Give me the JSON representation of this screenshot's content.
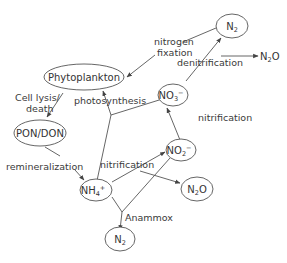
{
  "diagram": {
    "nodes": {
      "phytoplankton": "Phytoplankton",
      "pon_don": "PON/DON",
      "nh4": {
        "base": "NH",
        "sub": "4",
        "sup": "+"
      },
      "no2": {
        "base": "NO",
        "sub": "2",
        "sup": "−"
      },
      "no3": {
        "base": "NO",
        "sub": "3",
        "sup": "−"
      },
      "n2_top": {
        "base": "N",
        "sub": "2"
      },
      "n2_bottom": {
        "base": "N",
        "sub": "2"
      },
      "n2o_right": {
        "base": "N",
        "sub": "2",
        "tail": "O"
      },
      "n2o_top": {
        "base": "N",
        "sub": "2",
        "tail": "O"
      }
    },
    "labels": {
      "nitrogen_fixation_1": "nitrogen",
      "nitrogen_fixation_2": "fixation",
      "denitrification": "denitrification",
      "cell_lysis_1": "Cell lysis/",
      "cell_lysis_2": "death",
      "photosynthesis": "photosynthesis",
      "remineralization": "remineralization",
      "nitrification_upper": "nitrification",
      "nitrification_lower": "nitrification",
      "anammox": "Anammox"
    },
    "colors": {
      "line": "#555555",
      "text": "#333333",
      "background": "#ffffff"
    }
  }
}
